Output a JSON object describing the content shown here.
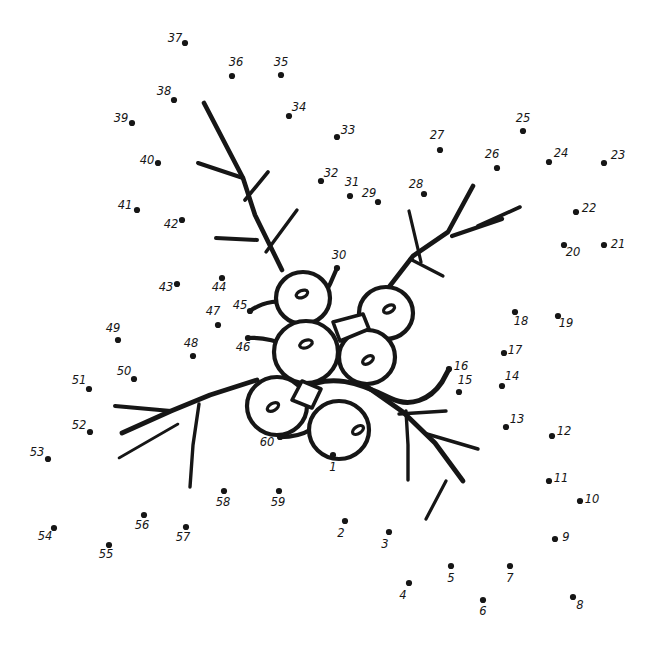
{
  "page": {
    "width": 661,
    "height": 650,
    "background_color": "#ffffff",
    "ink_color": "#161616",
    "dot_count": 60
  },
  "dots": [
    {
      "n": "1",
      "x": 333,
      "y": 455,
      "lx": 333,
      "ly": 471
    },
    {
      "n": "2",
      "x": 345,
      "y": 521,
      "lx": 341,
      "ly": 537
    },
    {
      "n": "3",
      "x": 389,
      "y": 532,
      "lx": 385,
      "ly": 548
    },
    {
      "n": "4",
      "x": 409,
      "y": 583,
      "lx": 403,
      "ly": 599
    },
    {
      "n": "5",
      "x": 451,
      "y": 566,
      "lx": 451,
      "ly": 582
    },
    {
      "n": "6",
      "x": 483,
      "y": 600,
      "lx": 483,
      "ly": 615
    },
    {
      "n": "7",
      "x": 510,
      "y": 566,
      "lx": 510,
      "ly": 582
    },
    {
      "n": "8",
      "x": 573,
      "y": 597,
      "lx": 580,
      "ly": 609
    },
    {
      "n": "9",
      "x": 555,
      "y": 539,
      "lx": 566,
      "ly": 541
    },
    {
      "n": "10",
      "x": 580,
      "y": 501,
      "lx": 592,
      "ly": 503
    },
    {
      "n": "11",
      "x": 549,
      "y": 481,
      "lx": 561,
      "ly": 482
    },
    {
      "n": "12",
      "x": 552,
      "y": 436,
      "lx": 564,
      "ly": 435
    },
    {
      "n": "13",
      "x": 506,
      "y": 427,
      "lx": 517,
      "ly": 423
    },
    {
      "n": "14",
      "x": 502,
      "y": 386,
      "lx": 512,
      "ly": 380
    },
    {
      "n": "15",
      "x": 459,
      "y": 392,
      "lx": 465,
      "ly": 384
    },
    {
      "n": "16",
      "x": 449,
      "y": 369,
      "lx": 461,
      "ly": 370
    },
    {
      "n": "17",
      "x": 504,
      "y": 353,
      "lx": 515,
      "ly": 354
    },
    {
      "n": "18",
      "x": 515,
      "y": 312,
      "lx": 521,
      "ly": 325
    },
    {
      "n": "19",
      "x": 558,
      "y": 316,
      "lx": 566,
      "ly": 327
    },
    {
      "n": "20",
      "x": 564,
      "y": 245,
      "lx": 573,
      "ly": 256
    },
    {
      "n": "21",
      "x": 604,
      "y": 245,
      "lx": 618,
      "ly": 248
    },
    {
      "n": "22",
      "x": 576,
      "y": 212,
      "lx": 589,
      "ly": 212
    },
    {
      "n": "23",
      "x": 604,
      "y": 163,
      "lx": 618,
      "ly": 159
    },
    {
      "n": "24",
      "x": 549,
      "y": 162,
      "lx": 561,
      "ly": 157
    },
    {
      "n": "25",
      "x": 523,
      "y": 131,
      "lx": 523,
      "ly": 122
    },
    {
      "n": "26",
      "x": 497,
      "y": 168,
      "lx": 492,
      "ly": 158
    },
    {
      "n": "27",
      "x": 440,
      "y": 150,
      "lx": 437,
      "ly": 139
    },
    {
      "n": "28",
      "x": 424,
      "y": 194,
      "lx": 416,
      "ly": 188
    },
    {
      "n": "29",
      "x": 378,
      "y": 202,
      "lx": 369,
      "ly": 197
    },
    {
      "n": "30",
      "x": 337,
      "y": 268,
      "lx": 339,
      "ly": 259
    },
    {
      "n": "31",
      "x": 350,
      "y": 196,
      "lx": 352,
      "ly": 186
    },
    {
      "n": "32",
      "x": 321,
      "y": 181,
      "lx": 331,
      "ly": 177
    },
    {
      "n": "33",
      "x": 337,
      "y": 137,
      "lx": 348,
      "ly": 134
    },
    {
      "n": "34",
      "x": 289,
      "y": 116,
      "lx": 299,
      "ly": 111
    },
    {
      "n": "35",
      "x": 281,
      "y": 75,
      "lx": 281,
      "ly": 66
    },
    {
      "n": "36",
      "x": 232,
      "y": 76,
      "lx": 236,
      "ly": 66
    },
    {
      "n": "37",
      "x": 185,
      "y": 43,
      "lx": 175,
      "ly": 42
    },
    {
      "n": "38",
      "x": 174,
      "y": 100,
      "lx": 164,
      "ly": 95
    },
    {
      "n": "39",
      "x": 132,
      "y": 123,
      "lx": 121,
      "ly": 122
    },
    {
      "n": "40",
      "x": 158,
      "y": 163,
      "lx": 147,
      "ly": 164
    },
    {
      "n": "41",
      "x": 137,
      "y": 210,
      "lx": 125,
      "ly": 209
    },
    {
      "n": "42",
      "x": 182,
      "y": 220,
      "lx": 171,
      "ly": 228
    },
    {
      "n": "43",
      "x": 177,
      "y": 284,
      "lx": 166,
      "ly": 291
    },
    {
      "n": "44",
      "x": 222,
      "y": 278,
      "lx": 219,
      "ly": 291
    },
    {
      "n": "45",
      "x": 250,
      "y": 311,
      "lx": 240,
      "ly": 309
    },
    {
      "n": "46",
      "x": 248,
      "y": 338,
      "lx": 243,
      "ly": 351
    },
    {
      "n": "47",
      "x": 218,
      "y": 325,
      "lx": 213,
      "ly": 315
    },
    {
      "n": "48",
      "x": 193,
      "y": 356,
      "lx": 191,
      "ly": 347
    },
    {
      "n": "49",
      "x": 118,
      "y": 340,
      "lx": 113,
      "ly": 332
    },
    {
      "n": "50",
      "x": 134,
      "y": 379,
      "lx": 124,
      "ly": 375
    },
    {
      "n": "51",
      "x": 89,
      "y": 389,
      "lx": 79,
      "ly": 384
    },
    {
      "n": "52",
      "x": 90,
      "y": 432,
      "lx": 79,
      "ly": 429
    },
    {
      "n": "53",
      "x": 48,
      "y": 459,
      "lx": 37,
      "ly": 456
    },
    {
      "n": "54",
      "x": 54,
      "y": 528,
      "lx": 45,
      "ly": 540
    },
    {
      "n": "55",
      "x": 109,
      "y": 545,
      "lx": 106,
      "ly": 558
    },
    {
      "n": "56",
      "x": 144,
      "y": 515,
      "lx": 142,
      "ly": 529
    },
    {
      "n": "57",
      "x": 186,
      "y": 527,
      "lx": 183,
      "ly": 541
    },
    {
      "n": "58",
      "x": 224,
      "y": 491,
      "lx": 223,
      "ly": 506
    },
    {
      "n": "59",
      "x": 279,
      "y": 491,
      "lx": 278,
      "ly": 506
    },
    {
      "n": "60",
      "x": 280,
      "y": 437,
      "lx": 267,
      "ly": 446
    }
  ],
  "berries": [
    {
      "id": "berry-top-left",
      "cx": 303,
      "cy": 298,
      "rx": 27,
      "ry": 26,
      "eye_cx": 302,
      "eye_cy": 294,
      "eye_rx": 6,
      "eye_ry": 3.4,
      "eye_rot": -22
    },
    {
      "id": "berry-top-right",
      "cx": 386,
      "cy": 313,
      "rx": 27,
      "ry": 26,
      "eye_cx": 389,
      "eye_cy": 309,
      "eye_rx": 6,
      "eye_ry": 3.4,
      "eye_rot": -28
    },
    {
      "id": "berry-mid-right",
      "cx": 367,
      "cy": 357,
      "rx": 28,
      "ry": 27,
      "eye_cx": 368,
      "eye_cy": 360,
      "eye_rx": 6,
      "eye_ry": 3.4,
      "eye_rot": -32
    },
    {
      "id": "berry-center",
      "cx": 306,
      "cy": 352,
      "rx": 32,
      "ry": 31,
      "eye_cx": 306,
      "eye_cy": 344,
      "eye_rx": 6.5,
      "eye_ry": 3.6,
      "eye_rot": -20
    },
    {
      "id": "berry-lower-left",
      "cx": 277,
      "cy": 406,
      "rx": 30,
      "ry": 29,
      "eye_cx": 273,
      "eye_cy": 407,
      "eye_rx": 6.2,
      "eye_ry": 3.5,
      "eye_rot": -30
    },
    {
      "id": "berry-lower-right",
      "cx": 339,
      "cy": 430,
      "rx": 30,
      "ry": 29,
      "eye_cx": 358,
      "eye_cy": 430,
      "eye_rx": 6.2,
      "eye_ry": 3.5,
      "eye_rot": -34
    }
  ],
  "branches": {
    "upper_left_stem": "M 204 103 L 243 178 L 255 215 L 282 270",
    "upper_left_twig1": "M 198 163 L 243 178",
    "upper_left_twig2": "M 268 172 L 245 200",
    "upper_left_twig3": "M 216 238 L 257 240",
    "upper_left_twig4": "M 297 210 L 266 252",
    "upper_right_stem": "M 473 186 L 448 232 L 413 256 L 389 287",
    "upper_right_twig1": "M 520 207 L 478 226",
    "upper_right_twig2": "M 502 219 L 452 236",
    "upper_right_twig3": "M 409 211 L 421 262",
    "upper_right_twig4": "M 443 276 L 410 259",
    "left_stem": "M 257 380 L 210 395 L 171 411 L 122 433",
    "left_twig1": "M 115 406 L 171 411",
    "left_twig2": "M 178 424 L 119 458",
    "left_twig3": "M 199 404 L 193 445 L 190 487",
    "right_stem": "M 366 386 L 403 412 L 435 443 L 463 481",
    "right_twig1": "M 446 411 L 399 414",
    "right_twig2": "M 406 411 L 408 445 L 408 480",
    "right_twig3": "M 478 449 L 427 434",
    "right_twig4": "M 446 481 L 426 519",
    "stem_45": "M 250 311 C 262 302 282 298 294 305",
    "stem_46": "M 248 338 C 263 337 281 341 292 350",
    "stem_30": "M 337 268 C 332 281 328 289 322 299",
    "stem_1": "M 333 455 L 334 443",
    "stem_60": "M 280 437 C 292 437 302 435 310 430",
    "vine_16": "M 300 390 C 330 372 360 383 390 398 C 410 408 430 400 442 382 L 449 369"
  },
  "wedges": [
    {
      "id": "wedge-upper",
      "path": "M 333 322 L 363 314 L 369 329 L 340 341 Z"
    },
    {
      "id": "wedge-lower",
      "path": "M 302 381 L 321 389 L 312 408 L 292 400 Z"
    }
  ]
}
